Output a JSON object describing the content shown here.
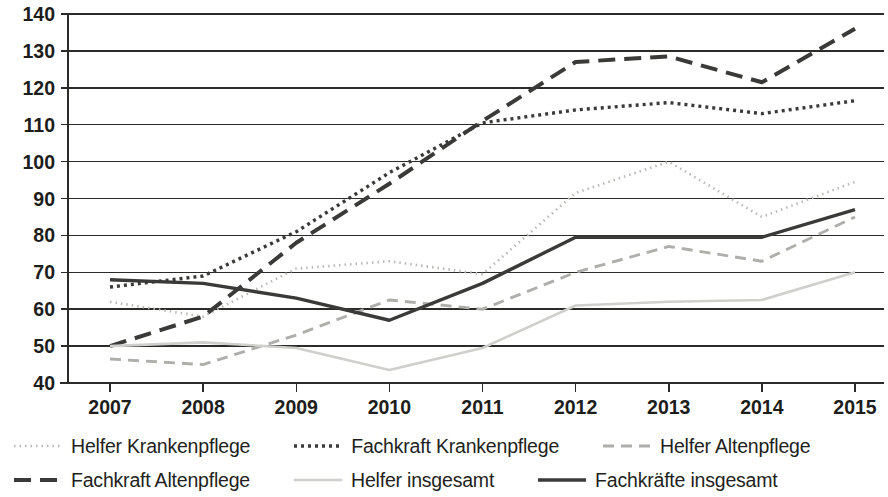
{
  "chart_data": {
    "type": "line",
    "title": "",
    "xlabel": "",
    "ylabel": "",
    "categories": [
      "2007",
      "2008",
      "2009",
      "2010",
      "2011",
      "2012",
      "2013",
      "2014",
      "2015"
    ],
    "x": [
      2007,
      2008,
      2009,
      2010,
      2011,
      2012,
      2013,
      2014,
      2015
    ],
    "ylim": [
      40,
      140
    ],
    "yticks": [
      40,
      50,
      60,
      70,
      80,
      90,
      100,
      110,
      120,
      130,
      140
    ],
    "ytick_labels": [
      "40",
      "50",
      "60",
      "70",
      "80",
      "90",
      "100",
      "110",
      "120",
      "130",
      "140"
    ],
    "grid": "horizontal",
    "legend_position": "bottom",
    "series": [
      {
        "name": "Helfer Krankenpflege",
        "values": [
          62,
          58,
          71,
          73,
          69.5,
          91.5,
          100,
          85,
          94.5
        ],
        "color": "#b9b9b5",
        "style": "dotted",
        "dasharray": "1.5 4",
        "width": 2.6
      },
      {
        "name": "Fachkraft Krankenpflege",
        "values": [
          66,
          69,
          81,
          97,
          110.5,
          114,
          116,
          113,
          116.5
        ],
        "color": "#3a3a38",
        "style": "dotted",
        "dasharray": "3 4",
        "width": 3.4
      },
      {
        "name": "Helfer Altenpflege",
        "values": [
          46.5,
          45,
          53,
          62.5,
          60,
          70,
          77,
          73,
          85
        ],
        "color": "#aeaeaa",
        "style": "dashed",
        "dasharray": "11 7",
        "width": 2.9
      },
      {
        "name": "Fachkraft Altenpflege",
        "values": [
          50,
          58,
          78,
          94,
          111,
          127,
          128.5,
          121.5,
          136
        ],
        "color": "#3a3a38",
        "style": "long-dash",
        "dasharray": "17 9",
        "width": 4.0
      },
      {
        "name": "Helfer insgesamt",
        "values": [
          50,
          51,
          49.5,
          43.5,
          49.5,
          61,
          62,
          62.5,
          70
        ],
        "color": "#cfcfcb",
        "style": "solid",
        "dasharray": "",
        "width": 2.6
      },
      {
        "name": "Fachkräfte insgesamt",
        "values": [
          68,
          67,
          63,
          57,
          67,
          79.5,
          79.5,
          79.5,
          87
        ],
        "color": "#3a3a38",
        "style": "solid",
        "dasharray": "",
        "width": 3.4
      }
    ]
  },
  "legend": {
    "rows": [
      [
        {
          "label": "Helfer Krankenpflege",
          "series": 0
        },
        {
          "label": "Fachkraft Krankenpflege",
          "series": 1
        },
        {
          "label": "Helfer Altenpflege",
          "series": 2
        }
      ],
      [
        {
          "label": "Fachkraft Altenpflege",
          "series": 3
        },
        {
          "label": "Helfer insgesamt",
          "series": 4
        },
        {
          "label": "Fachkräfte insgesamt",
          "series": 5
        }
      ]
    ]
  },
  "colors": {
    "axis": "#2b2b29",
    "text": "#231f20",
    "background": "#ffffff"
  }
}
